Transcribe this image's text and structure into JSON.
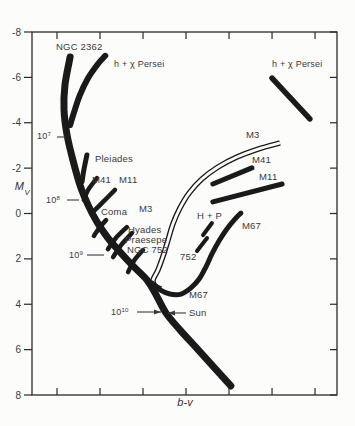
{
  "figure": {
    "background": "#fcfcfa",
    "ink": "#1a1a1a",
    "text_color": "#3a3a3a"
  },
  "chart_data": {
    "type": "line",
    "xlabel": {
      "base": "b-v",
      "italic": true
    },
    "ylabel": {
      "base": "M",
      "sub": "V",
      "italic": true
    },
    "x_axis": {
      "tick_fractions": [
        0.082,
        0.223,
        0.364,
        0.505,
        0.646,
        0.787,
        0.928
      ],
      "tick_labels_visible": false,
      "note": "x tick values are not printed in the figure; x given as fraction of axis width"
    },
    "y_axis": {
      "ticks": [
        -8,
        -6,
        -4,
        -2,
        0,
        2,
        4,
        6,
        8
      ],
      "min": -8,
      "max": 8,
      "increases_downward": true
    },
    "y_units": "absolute magnitude M_V",
    "age_markers": [
      {
        "base": "10",
        "sup": "7",
        "Mv": -3.4
      },
      {
        "base": "10",
        "sup": "8",
        "Mv": -0.6
      },
      {
        "base": "10",
        "sup": "9",
        "Mv": 1.8
      },
      {
        "base": "10",
        "sup": "10",
        "Mv": 4.3
      }
    ],
    "sun_marker": {
      "label": "Sun",
      "Mv": 4.4
    },
    "series": [
      {
        "id": "main-sequence",
        "label": "NGC 2362 / main sequence",
        "style": "solid",
        "width": 7,
        "points": [
          [
            0.125,
            -6.9
          ],
          [
            0.108,
            -5.66
          ],
          [
            0.105,
            -4.56
          ],
          [
            0.115,
            -3.46
          ],
          [
            0.134,
            -2.36
          ],
          [
            0.157,
            -1.26
          ],
          [
            0.184,
            -0.37
          ],
          [
            0.213,
            0.37
          ],
          [
            0.249,
            1.08
          ],
          [
            0.289,
            1.7
          ],
          [
            0.331,
            2.31
          ],
          [
            0.377,
            2.93
          ],
          [
            0.407,
            3.59
          ],
          [
            0.439,
            4.38
          ],
          [
            0.485,
            5.13
          ],
          [
            0.551,
            6.1
          ],
          [
            0.652,
            7.6
          ]
        ]
      },
      {
        "id": "h-chi-persei-branch",
        "label": "h + χ Persei",
        "style": "solid",
        "width": 6,
        "points": [
          [
            0.24,
            -6.95
          ],
          [
            0.216,
            -6.59
          ],
          [
            0.184,
            -5.97
          ],
          [
            0.157,
            -5.22
          ],
          [
            0.138,
            -4.47
          ],
          [
            0.125,
            -3.9
          ]
        ]
      },
      {
        "id": "h-chi-persei-giants",
        "label": "h + χ Persei (giants)",
        "style": "solid",
        "width": 5.5,
        "points": [
          [
            0.787,
            -5.97
          ],
          [
            0.911,
            -4.17
          ]
        ]
      },
      {
        "id": "pleiades-branch",
        "label": "Pleiades",
        "style": "solid",
        "width": 5,
        "points": [
          [
            0.18,
            -2.58
          ],
          [
            0.17,
            -1.92
          ],
          [
            0.164,
            -1.39
          ]
        ]
      },
      {
        "id": "m41-branch",
        "label": "M41",
        "style": "solid",
        "width": 4.5,
        "points": [
          [
            0.213,
            -1.56
          ],
          [
            0.184,
            -1.04
          ],
          [
            0.17,
            -0.6
          ]
        ]
      },
      {
        "id": "m11-branch",
        "label": "M11",
        "style": "solid",
        "width": 4.5,
        "points": [
          [
            0.272,
            -1.04
          ],
          [
            0.233,
            -0.51
          ],
          [
            0.2,
            -0.07
          ]
        ]
      },
      {
        "id": "coma-branch",
        "label": "Coma",
        "style": "solid",
        "width": 4.5,
        "points": [
          [
            0.243,
            0.29
          ],
          [
            0.22,
            0.64
          ],
          [
            0.203,
            0.99
          ]
        ]
      },
      {
        "id": "hyades-branch",
        "label": "Hyades",
        "style": "solid",
        "width": 4.5,
        "points": [
          [
            0.311,
            0.6
          ],
          [
            0.275,
            1.08
          ],
          [
            0.249,
            1.57
          ]
        ]
      },
      {
        "id": "praesepe-branch",
        "label": "Praesepe",
        "style": "solid",
        "width": 4.5,
        "points": [
          [
            0.328,
            0.86
          ],
          [
            0.292,
            1.39
          ],
          [
            0.266,
            1.92
          ]
        ]
      },
      {
        "id": "ngc752-branch",
        "label": "NGC 752",
        "style": "solid",
        "width": 4.5,
        "points": [
          [
            0.364,
            1.61
          ],
          [
            0.334,
            2.09
          ],
          [
            0.315,
            2.58
          ]
        ]
      },
      {
        "id": "m3-sequence",
        "label": "M3 / 752 (outlined)",
        "style": "outline",
        "width": 5.5,
        "points": [
          [
            0.813,
            -3.11
          ],
          [
            0.741,
            -2.84
          ],
          [
            0.672,
            -2.49
          ],
          [
            0.61,
            -2.05
          ],
          [
            0.557,
            -1.52
          ],
          [
            0.515,
            -0.9
          ],
          [
            0.485,
            -0.24
          ],
          [
            0.462,
            0.46
          ],
          [
            0.446,
            1.17
          ],
          [
            0.43,
            1.87
          ],
          [
            0.413,
            2.49
          ],
          [
            0.397,
            2.93
          ],
          [
            0.403,
            3.19
          ],
          [
            0.423,
            3.33
          ]
        ]
      },
      {
        "id": "m41-giants",
        "label": "M41 (giants)",
        "style": "solid",
        "width": 5,
        "points": [
          [
            0.593,
            -1.3
          ],
          [
            0.721,
            -2.01
          ]
        ]
      },
      {
        "id": "m11-giants",
        "label": "M11 (giants)",
        "style": "solid",
        "width": 5,
        "points": [
          [
            0.593,
            -0.51
          ],
          [
            0.82,
            -1.3
          ]
        ]
      },
      {
        "id": "h-p-dash-upper",
        "label": "H + P",
        "style": "solid",
        "width": 4,
        "points": [
          [
            0.59,
            0.42
          ],
          [
            0.561,
            0.95
          ]
        ]
      },
      {
        "id": "h-p-dash-lower",
        "label": "H + P",
        "style": "solid",
        "width": 4,
        "points": [
          [
            0.574,
            1.08
          ],
          [
            0.541,
            1.65
          ]
        ]
      },
      {
        "id": "m67-sequence",
        "label": "M67",
        "style": "solid",
        "width": 5,
        "points": [
          [
            0.393,
            3.06
          ],
          [
            0.42,
            3.37
          ],
          [
            0.452,
            3.55
          ],
          [
            0.489,
            3.55
          ],
          [
            0.521,
            3.28
          ],
          [
            0.548,
            2.89
          ],
          [
            0.57,
            2.36
          ],
          [
            0.59,
            1.78
          ],
          [
            0.613,
            1.21
          ],
          [
            0.639,
            0.68
          ],
          [
            0.666,
            0.24
          ],
          [
            0.685,
            -0.02
          ]
        ]
      }
    ],
    "annotations": {
      "labels": [
        {
          "id": "ngc-2362",
          "text": "NGC 2362",
          "x": 56,
          "y": 47,
          "size": 9.5
        },
        {
          "id": "h-chi-persei-left",
          "text": "h + χ Persei",
          "x": 114,
          "y": 64,
          "size": 9
        },
        {
          "id": "h-chi-persei-right",
          "text": "h + χ Persei",
          "x": 272,
          "y": 64,
          "size": 9
        },
        {
          "id": "age-1e7",
          "base": "10",
          "sup": "7",
          "x": 37,
          "y": 136,
          "size": 9
        },
        {
          "id": "pleiades",
          "text": "Pleiades",
          "x": 95,
          "y": 159,
          "size": 9.5
        },
        {
          "id": "m41-left",
          "text": "M41",
          "x": 92,
          "y": 180,
          "size": 9.5
        },
        {
          "id": "m11-left",
          "text": "M11",
          "x": 119,
          "y": 180,
          "size": 9.5
        },
        {
          "id": "age-1e8",
          "base": "10",
          "sup": "8",
          "x": 46,
          "y": 200,
          "size": 9
        },
        {
          "id": "coma",
          "text": "Coma",
          "x": 101,
          "y": 212,
          "size": 9.5
        },
        {
          "id": "m3-top",
          "text": "M3",
          "x": 246,
          "y": 135,
          "size": 9.5
        },
        {
          "id": "m41-right",
          "text": "M41",
          "x": 252,
          "y": 160,
          "size": 9.5
        },
        {
          "id": "m11-right",
          "text": "M11",
          "x": 259,
          "y": 177,
          "size": 9.5
        },
        {
          "id": "m3-left",
          "text": "M3",
          "x": 139,
          "y": 209,
          "size": 9.5
        },
        {
          "id": "h-p",
          "text": "H + P",
          "x": 197,
          "y": 216,
          "size": 9.5
        },
        {
          "id": "hyades",
          "text": "Hyades",
          "x": 128,
          "y": 230,
          "size": 9.5
        },
        {
          "id": "praesepe",
          "text": "Praesepe",
          "x": 125,
          "y": 240,
          "size": 9.5
        },
        {
          "id": "ngc-752",
          "text": "NGC 752",
          "x": 127,
          "y": 250,
          "size": 9.5
        },
        {
          "id": "age-1e9",
          "base": "10",
          "sup": "9",
          "x": 69,
          "y": 255,
          "size": 9
        },
        {
          "id": "m67-upper",
          "text": "M67",
          "x": 242,
          "y": 226,
          "size": 9.5
        },
        {
          "id": "s752",
          "text": "752",
          "x": 180,
          "y": 257,
          "size": 9.5
        },
        {
          "id": "m67-lower",
          "text": "M67",
          "x": 189,
          "y": 295,
          "size": 9.5
        },
        {
          "id": "age-1e10",
          "base": "10",
          "sup": "10",
          "x": 111,
          "y": 312,
          "size": 9
        },
        {
          "id": "sun",
          "text": "Sun",
          "x": 189,
          "y": 313,
          "size": 9.5
        }
      ],
      "leaders": [
        {
          "id": "leader-1e7",
          "x1": 57,
          "y1": 137,
          "x2": 66,
          "y2": 137,
          "arrow": false
        },
        {
          "id": "leader-1e8",
          "x1": 67,
          "y1": 200,
          "x2": 79,
          "y2": 200,
          "arrow": false
        },
        {
          "id": "leader-1e9",
          "x1": 87,
          "y1": 255,
          "x2": 104,
          "y2": 255,
          "arrow": false
        },
        {
          "id": "leader-1e10",
          "x1": 137,
          "y1": 312,
          "x2": 161,
          "y2": 312,
          "arrow": true
        },
        {
          "id": "leader-sun",
          "x1": 186,
          "y1": 313,
          "x2": 168,
          "y2": 313,
          "arrow": true
        }
      ]
    }
  }
}
